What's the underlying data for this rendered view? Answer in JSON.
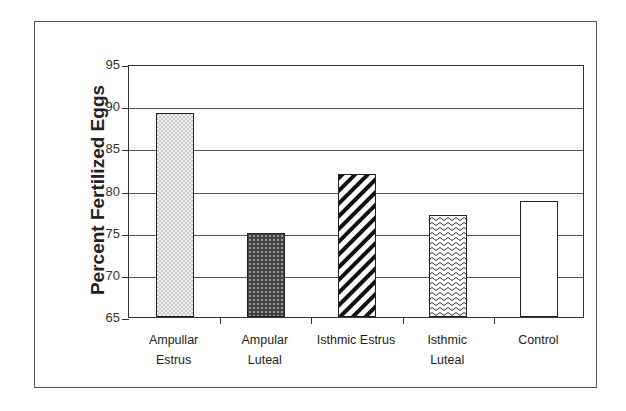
{
  "chart_data": {
    "type": "bar",
    "title": "",
    "xlabel": "",
    "ylabel": "Percent Fertilized Eggs",
    "ylim": [
      65,
      95
    ],
    "yticks": [
      65,
      70,
      75,
      80,
      85,
      90,
      95
    ],
    "grid": true,
    "legend": null,
    "categories": [
      "Ampullar Estrus",
      "Ampular Luteal",
      "Isthmic Estrus",
      "Isthmic Luteal",
      "Control"
    ],
    "values": [
      89.2,
      75.0,
      82.0,
      77.1,
      78.7
    ],
    "patterns": [
      "fine-dots",
      "dark-crosshatch",
      "diagonal-stripes",
      "wavy-lines",
      "blank"
    ]
  },
  "axis": {
    "y_title": "Percent Fertilized Eggs",
    "y_labels": [
      "95",
      "90",
      "85",
      "80",
      "75",
      "70",
      "65"
    ]
  },
  "labels": [
    "Ampullar\nEstrus",
    "Ampular\nLuteal",
    "Isthmic Estrus",
    "Isthmic\nLuteal",
    "Control"
  ]
}
